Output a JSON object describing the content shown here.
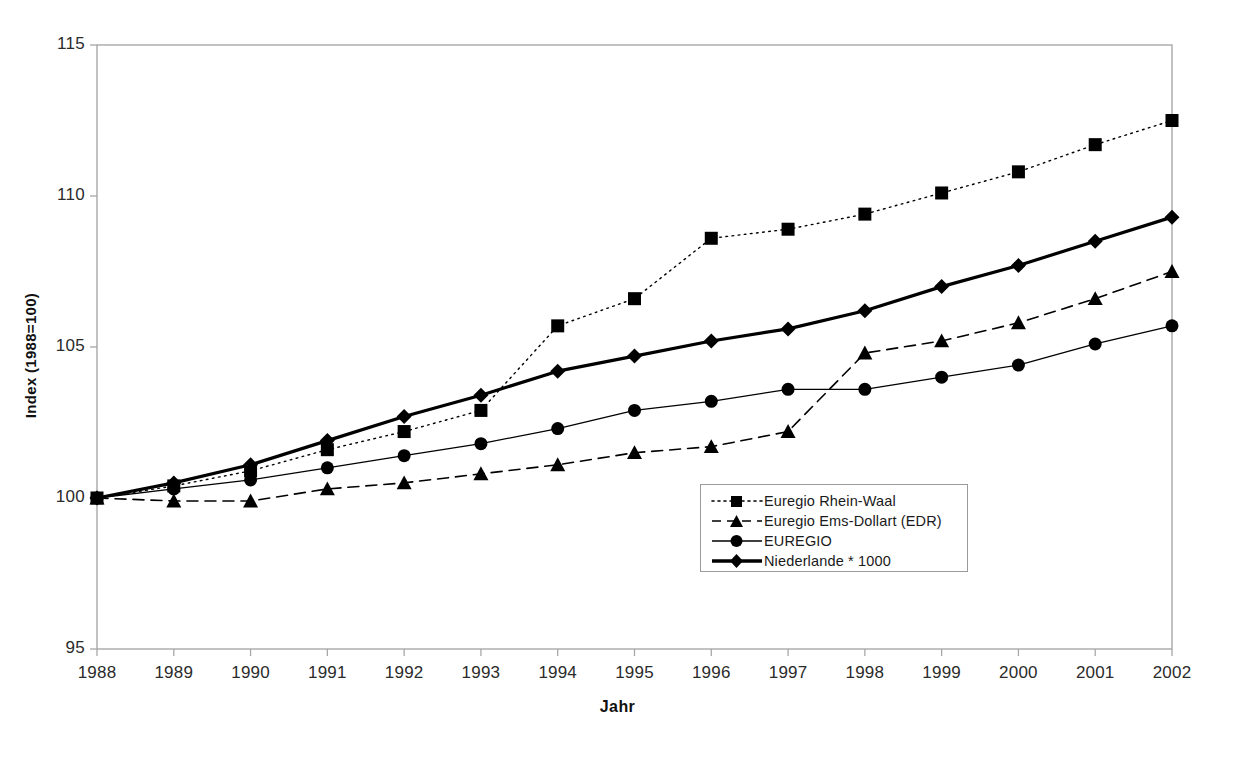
{
  "chart_data": {
    "type": "line",
    "title": "",
    "xlabel": "Jahr",
    "ylabel": "Index (1988=100)",
    "x": [
      1988,
      1989,
      1990,
      1991,
      1992,
      1993,
      1994,
      1995,
      1996,
      1997,
      1998,
      1999,
      2000,
      2001,
      2002
    ],
    "xlim": [
      1988,
      2002
    ],
    "ylim": [
      95,
      115
    ],
    "yticks": [
      95,
      100,
      105,
      110,
      115
    ],
    "xticks": [
      "1988",
      "1989",
      "1990",
      "1991",
      "1992",
      "1993",
      "1994",
      "1995",
      "1996",
      "1997",
      "1998",
      "1999",
      "2000",
      "2001",
      "2002"
    ],
    "grid": false,
    "legend_position": "inside-lower-right",
    "series": [
      {
        "name": "Euregio Rhein-Waal",
        "marker": "square",
        "linestyle": "dotted",
        "linewidth": 1.4,
        "color": "#000000",
        "values": [
          100.0,
          100.4,
          100.9,
          101.6,
          102.2,
          102.9,
          105.7,
          106.6,
          108.6,
          108.9,
          109.4,
          110.1,
          110.8,
          111.7,
          112.5
        ]
      },
      {
        "name": "Euregio Ems-Dollart (EDR)",
        "marker": "triangle",
        "linestyle": "dashed",
        "linewidth": 1.6,
        "color": "#000000",
        "values": [
          100.0,
          99.9,
          99.9,
          100.3,
          100.5,
          100.8,
          101.1,
          101.5,
          101.7,
          102.2,
          104.8,
          105.2,
          105.8,
          106.6,
          107.5
        ]
      },
      {
        "name": "EUREGIO",
        "marker": "circle",
        "linestyle": "solid",
        "linewidth": 1.3,
        "color": "#000000",
        "values": [
          100.0,
          100.3,
          100.6,
          101.0,
          101.4,
          101.8,
          102.3,
          102.9,
          103.2,
          103.6,
          103.6,
          104.0,
          104.4,
          105.1,
          105.7
        ]
      },
      {
        "name": "Niederlande * 1000",
        "marker": "diamond",
        "linestyle": "solid",
        "linewidth": 3.2,
        "color": "#000000",
        "values": [
          100.0,
          100.5,
          101.1,
          101.9,
          102.7,
          103.4,
          104.2,
          104.7,
          105.2,
          105.6,
          106.2,
          107.0,
          107.7,
          108.5,
          109.3
        ]
      }
    ]
  },
  "axes": {
    "plot_left": 97,
    "plot_right": 1172,
    "plot_top": 45,
    "plot_bottom": 649,
    "frame_color": "#a8a8a8"
  }
}
